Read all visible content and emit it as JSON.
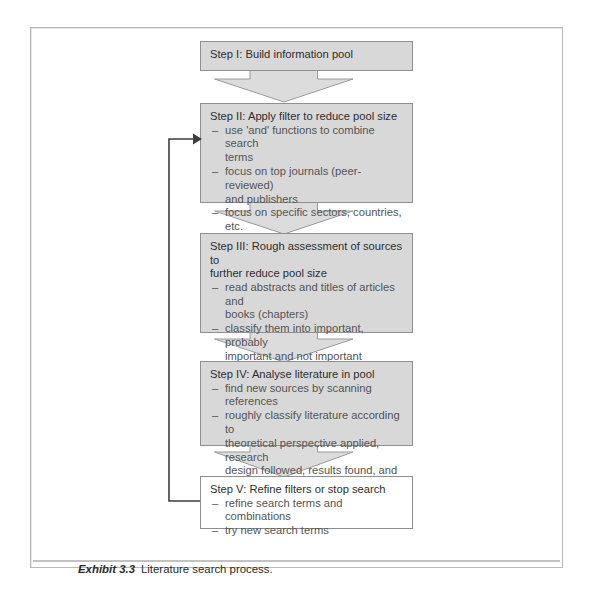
{
  "figure": {
    "caption_label": "Exhibit 3.3",
    "caption_text": "Literature search process.",
    "box_fill": "#d8d8d8",
    "box_border": "#8f8f8f",
    "arrow_fill": "#dcdcdc",
    "arrow_border": "#9a9a9a",
    "line_color": "#3d3d3d"
  },
  "steps": [
    {
      "id": "step-1",
      "title": "Step I: Build information pool",
      "bullets": []
    },
    {
      "id": "step-2",
      "title": "Step II: Apply filter to reduce pool size",
      "bullets": [
        "use 'and' functions to combine search\nterms",
        "focus on top journals (peer-reviewed)\nand publishers",
        "focus on specific sectors, countries, etc."
      ]
    },
    {
      "id": "step-3",
      "title": "Step III: Rough assessment of sources to\nfurther reduce pool size",
      "bullets": [
        "read abstracts and titles of articles and\nbooks (chapters)",
        "classify them into important, probably\nimportant and not important"
      ]
    },
    {
      "id": "step-4",
      "title": "Step IV: Analyse literature in pool",
      "bullets": [
        "find new sources by scanning references",
        "roughly classify literature according to\ntheoretical perspective applied, research\ndesign followed, results found, and\ndetect possible gaps"
      ]
    },
    {
      "id": "step-5",
      "title": "Step V: Refine filters or stop search",
      "bullets": [
        "refine search terms and combinations",
        "try new search terms"
      ]
    }
  ],
  "connectors": [
    {
      "id": "arrow-1-to-2",
      "from": "step-1",
      "to": "step-2"
    },
    {
      "id": "arrow-2-to-3",
      "from": "step-2",
      "to": "step-3"
    },
    {
      "id": "arrow-3-to-4",
      "from": "step-3",
      "to": "step-4"
    },
    {
      "id": "arrow-4-to-5",
      "from": "step-4",
      "to": "step-5"
    },
    {
      "id": "feedback-loop",
      "from": "step-5",
      "to": "step-2"
    }
  ],
  "bullet_marker": "–"
}
